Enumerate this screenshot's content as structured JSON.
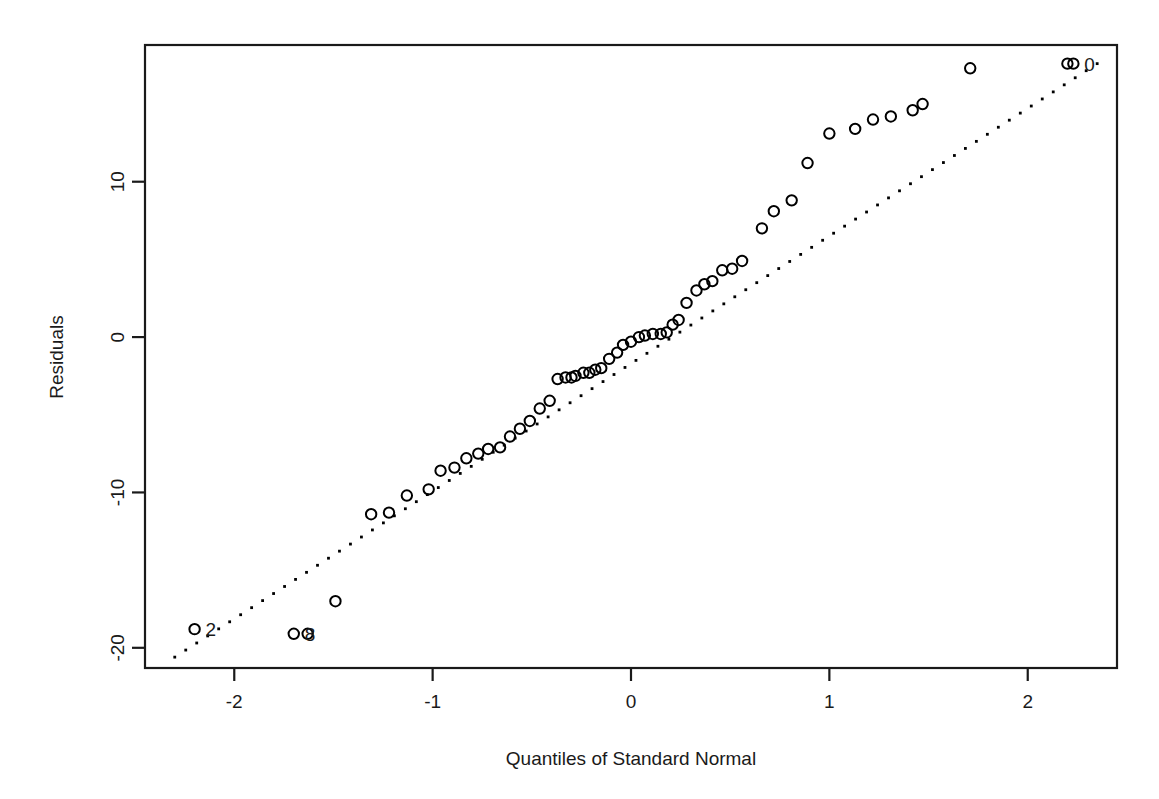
{
  "chart_data": {
    "type": "scatter",
    "title": "",
    "subtitle": "",
    "xlabel": "Quantiles of Standard Normal",
    "ylabel": "Residuals",
    "xlim": [
      -2.45,
      2.45
    ],
    "ylim": [
      -21.3,
      18.8
    ],
    "grid": false,
    "legend": null,
    "x_ticks": [
      -2,
      -1,
      0,
      1,
      2
    ],
    "x_tick_labels": [
      "-2",
      "-1",
      "0",
      "1",
      "2"
    ],
    "y_ticks": [
      10,
      0,
      -10,
      -20
    ],
    "y_tick_labels": [
      "10",
      "0",
      "-10",
      "-20"
    ],
    "marker": "open-circle",
    "reference_line": {
      "style": "dotted",
      "description": "dotted qq reference line through quartiles",
      "x_start": -2.3,
      "y_start": -20.6,
      "x_end": 2.35,
      "y_end": 17.6
    },
    "series": [
      {
        "name": "Residuals",
        "x": [
          -2.2,
          -1.7,
          -1.63,
          -1.49,
          -1.31,
          -1.22,
          -1.13,
          -1.02,
          -0.96,
          -0.89,
          -0.83,
          -0.77,
          -0.72,
          -0.66,
          -0.61,
          -0.56,
          -0.51,
          -0.46,
          -0.41,
          -0.37,
          -0.33,
          -0.3,
          -0.28,
          -0.24,
          -0.21,
          -0.18,
          -0.15,
          -0.11,
          -0.07,
          -0.04,
          0.0,
          0.04,
          0.07,
          0.11,
          0.15,
          0.18,
          0.21,
          0.24,
          0.28,
          0.33,
          0.37,
          0.41,
          0.46,
          0.51,
          0.56,
          0.66,
          0.72,
          0.81,
          0.89,
          1.0,
          1.13,
          1.22,
          1.31,
          1.42,
          1.47,
          1.71,
          2.2,
          2.23
        ],
        "y": [
          -18.8,
          -19.1,
          -19.1,
          -17.0,
          -11.4,
          -11.3,
          -10.2,
          -9.8,
          -8.6,
          -8.4,
          -7.8,
          -7.5,
          -7.2,
          -7.1,
          -6.4,
          -5.9,
          -5.4,
          -4.6,
          -4.1,
          -2.7,
          -2.6,
          -2.6,
          -2.5,
          -2.3,
          -2.3,
          -2.1,
          -2.0,
          -1.4,
          -1.0,
          -0.5,
          -0.3,
          0.0,
          0.1,
          0.2,
          0.2,
          0.3,
          0.8,
          1.1,
          2.2,
          3.0,
          3.4,
          3.6,
          4.3,
          4.4,
          4.9,
          7.0,
          8.1,
          8.8,
          11.2,
          13.1,
          13.4,
          14.0,
          14.2,
          14.6,
          15.0,
          17.3,
          17.6,
          17.6
        ]
      }
    ],
    "point_labels": [
      {
        "text": "2",
        "x": -2.2,
        "y": -18.8
      },
      {
        "text": "8",
        "x": -1.7,
        "y": -19.1
      },
      {
        "text": "0",
        "x": 2.23,
        "y": 17.6
      }
    ]
  },
  "figure": {
    "background_color": "#ffffff",
    "foreground_color": "#1a1a1a",
    "marker_color": "#000000"
  }
}
